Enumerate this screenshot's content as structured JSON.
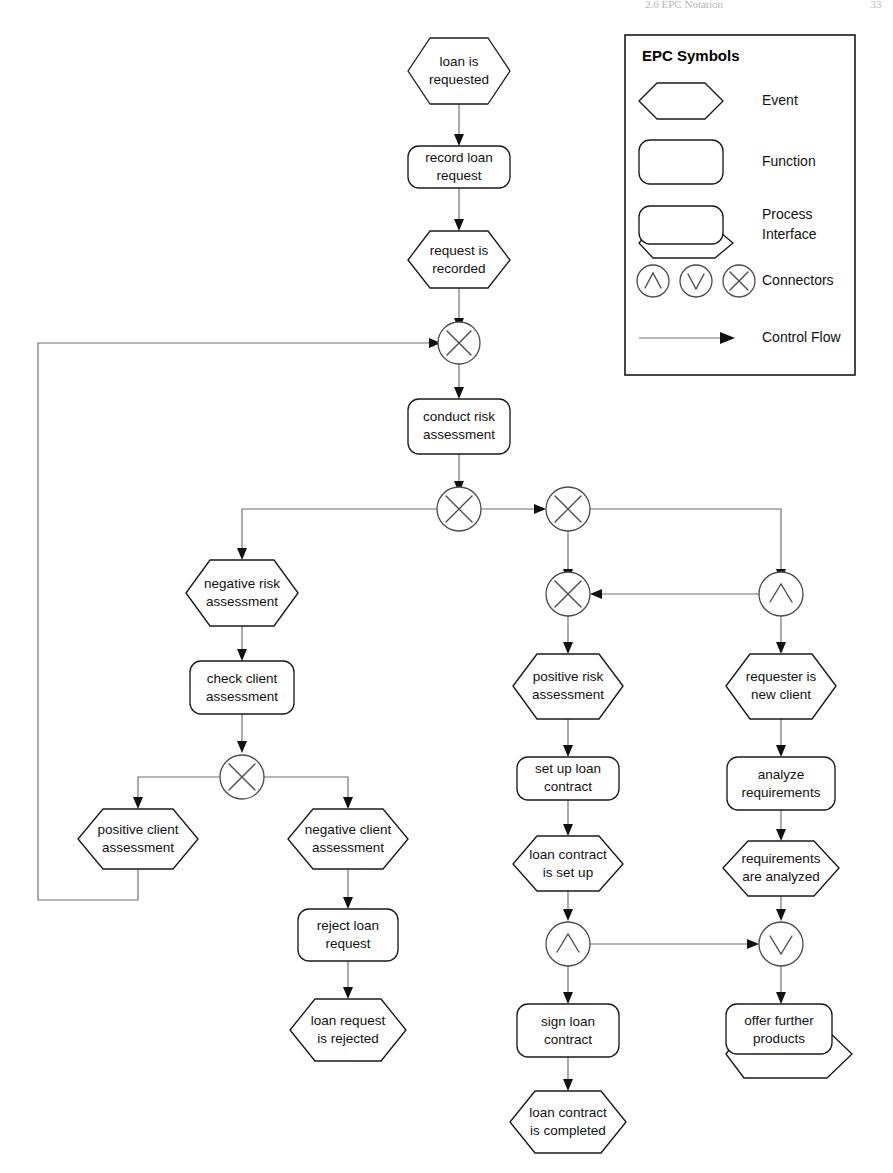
{
  "page": {
    "header_text": "2.6  EPC Notation",
    "page_number": "33"
  },
  "legend": {
    "title": "EPC Symbols",
    "items": [
      {
        "symbol": "event-hexagon",
        "label": "Event"
      },
      {
        "symbol": "function-rounded-rect",
        "label": "Function"
      },
      {
        "symbol": "process-interface",
        "label": "Process\nInterface"
      },
      {
        "symbol": "connectors-and-or-xor",
        "label": "Connectors"
      },
      {
        "symbol": "control-flow-arrow",
        "label": "Control Flow"
      }
    ],
    "item_labels": {
      "event": "Event",
      "function": "Function",
      "process_interface_line1": "Process",
      "process_interface_line2": "Interface",
      "connectors": "Connectors",
      "control_flow": "Control Flow"
    }
  },
  "diagram": {
    "nodes": [
      {
        "id": "e1",
        "type": "event",
        "line1": "loan is",
        "line2": "requested"
      },
      {
        "id": "f1",
        "type": "function",
        "line1": "record loan",
        "line2": "request"
      },
      {
        "id": "e2",
        "type": "event",
        "line1": "request is",
        "line2": "recorded"
      },
      {
        "id": "c1",
        "type": "connector-xor",
        "glyph": "X"
      },
      {
        "id": "f2",
        "type": "function",
        "line1": "conduct risk",
        "line2": "assessment"
      },
      {
        "id": "c2",
        "type": "connector-xor",
        "glyph": "X"
      },
      {
        "id": "c3",
        "type": "connector-xor",
        "glyph": "X"
      },
      {
        "id": "c4",
        "type": "connector-xor",
        "glyph": "X"
      },
      {
        "id": "c5",
        "type": "connector-and",
        "glyph": "A"
      },
      {
        "id": "e3",
        "type": "event",
        "line1": "negative risk",
        "line2": "assessment"
      },
      {
        "id": "f3",
        "type": "function",
        "line1": "check client",
        "line2": "assessment"
      },
      {
        "id": "c6",
        "type": "connector-xor",
        "glyph": "X"
      },
      {
        "id": "e4",
        "type": "event",
        "line1": "positive client",
        "line2": "assessment"
      },
      {
        "id": "e5",
        "type": "event",
        "line1": "negative client",
        "line2": "assessment"
      },
      {
        "id": "f4",
        "type": "function",
        "line1": "reject loan",
        "line2": "request"
      },
      {
        "id": "e6",
        "type": "event",
        "line1": "loan request",
        "line2": "is rejected"
      },
      {
        "id": "e7",
        "type": "event",
        "line1": "positive risk",
        "line2": "assessment"
      },
      {
        "id": "f5",
        "type": "function",
        "line1": "set up loan",
        "line2": "contract"
      },
      {
        "id": "e8",
        "type": "event",
        "line1": "loan contract",
        "line2": "is set up"
      },
      {
        "id": "c7",
        "type": "connector-and",
        "glyph": "A"
      },
      {
        "id": "f6",
        "type": "function",
        "line1": "sign loan",
        "line2": "contract"
      },
      {
        "id": "e9",
        "type": "event",
        "line1": "loan contract",
        "line2": "is completed"
      },
      {
        "id": "e10",
        "type": "event",
        "line1": "requester is",
        "line2": "new client"
      },
      {
        "id": "f7",
        "type": "function",
        "line1": "analyze",
        "line2": "requirements"
      },
      {
        "id": "e11",
        "type": "event",
        "line1": "requirements",
        "line2": "are analyzed"
      },
      {
        "id": "c8",
        "type": "connector-or",
        "glyph": "V"
      },
      {
        "id": "p1",
        "type": "process-interface",
        "line1": "offer further",
        "line2": "products"
      }
    ]
  },
  "colors": {
    "shape_stroke": "#1a1a1a",
    "flow_stroke": "#6e6e6e",
    "connector_stroke": "#4a4a4a",
    "text": "#111111",
    "background": "#ffffff"
  }
}
